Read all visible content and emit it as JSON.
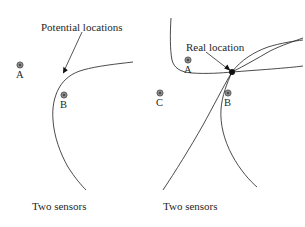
{
  "figure": {
    "background": "#ffffff",
    "stroke_color": "#2b2b2b",
    "sensor_marker_color": "#8f8f8f",
    "real_location_dot_color": "#111111"
  },
  "left_panel": {
    "name": "two-sensors-ambiguous",
    "annotation": "Potential locations",
    "caption": "Two sensors",
    "sensors": [
      {
        "label": "A",
        "x": 20,
        "y": 65
      },
      {
        "label": "B",
        "x": 64,
        "y": 95
      }
    ],
    "arrow_target": {
      "x": 63,
      "y": 73
    },
    "curve_count": 1
  },
  "right_panel": {
    "name": "three-sensors-resolved",
    "annotation": "Real location",
    "caption": "Two sensors",
    "sensors": [
      {
        "label": "A",
        "x": 188,
        "y": 60
      },
      {
        "label": "C",
        "x": 160,
        "y": 93
      },
      {
        "label": "B",
        "x": 228,
        "y": 93
      }
    ],
    "intersection": {
      "x": 232,
      "y": 72
    },
    "curve_count": 3
  }
}
